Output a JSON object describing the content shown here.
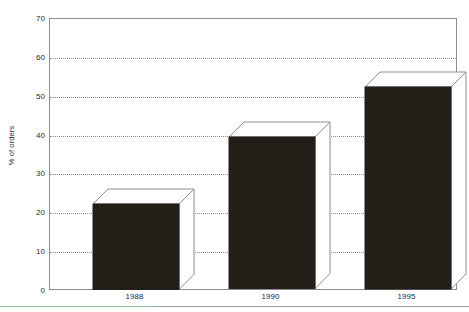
{
  "chart_data": {
    "type": "bar",
    "title": "",
    "subtitle": "",
    "xlabel": "",
    "ylabel": "% of orders",
    "categories": [
      "1988",
      "1990",
      "1995"
    ],
    "values": [
      22,
      39,
      52
    ],
    "series": [
      {
        "name": "% of orders",
        "values": [
          22,
          39,
          52
        ]
      }
    ],
    "ylim": [
      0,
      70
    ],
    "ytick_values": [
      0,
      10,
      20,
      30,
      40,
      50,
      60,
      70
    ],
    "ytick_labels": [
      "0",
      "10",
      "20",
      "30",
      "40",
      "50",
      "60",
      "70"
    ],
    "grid": "horizontal-dotted",
    "legend": "none",
    "style": "3d-bar",
    "bar_color": "#231f18",
    "grid_color": "#8a8a8a",
    "frame_color": "#8e8e8e",
    "background_color": "#ffffff",
    "annotations": []
  },
  "footer": {
    "rule_color": "#9a9a9a",
    "rule_accent_color": "#8fbf9a"
  }
}
